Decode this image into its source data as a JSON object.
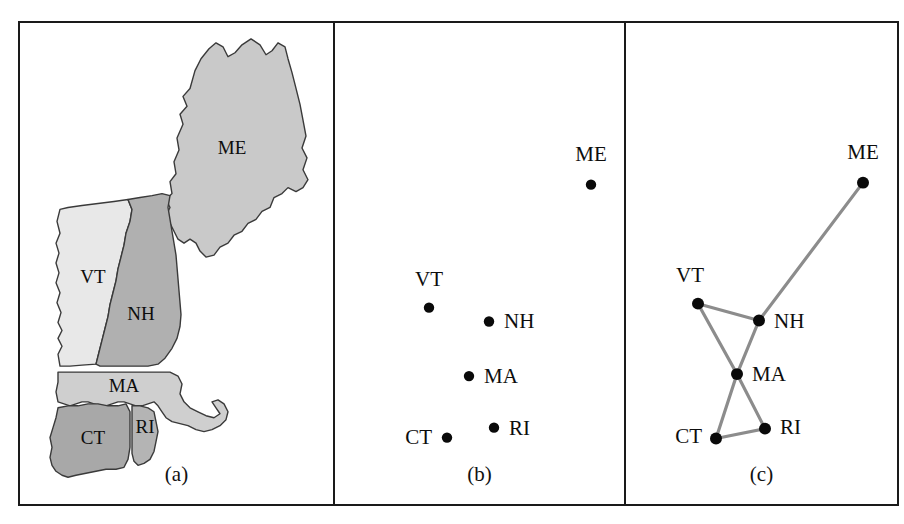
{
  "figure": {
    "width": 904,
    "height": 524,
    "background": "#ffffff",
    "frame_color": "#1a1a1a"
  },
  "panels": [
    {
      "id": "a",
      "caption": "(a)",
      "kind": "choropleth-map"
    },
    {
      "id": "b",
      "caption": "(b)",
      "kind": "scatter"
    },
    {
      "id": "c",
      "caption": "(c)",
      "kind": "graph"
    }
  ],
  "map": {
    "title": "New England states",
    "fills": {
      "ME": "#c9c9c9",
      "VT": "#e8e8e8",
      "NH": "#b0b0b0",
      "MA": "#cfcfcf",
      "CT": "#a8a8a8",
      "RI": "#b4b4b4"
    },
    "outline_color": "#3a3a3a",
    "regions": [
      {
        "code": "ME",
        "label": "ME",
        "label_x": 212,
        "label_y": 128
      },
      {
        "code": "VT",
        "label": "VT",
        "label_x": 73,
        "label_y": 258
      },
      {
        "code": "NH",
        "label": "NH",
        "label_x": 121,
        "label_y": 295
      },
      {
        "code": "MA",
        "label": "MA",
        "label_x": 104,
        "label_y": 368
      },
      {
        "code": "CT",
        "label": "CT",
        "label_x": 73,
        "label_y": 420
      },
      {
        "code": "RI",
        "label": "RI",
        "label_x": 125,
        "label_y": 409
      }
    ]
  },
  "chart_data": {
    "type": "scatter",
    "xlabel": "",
    "ylabel": "",
    "node_color": "#0a0a0a",
    "edge_color": "#8c8c8c",
    "nodes": [
      {
        "id": "ME",
        "label": "ME",
        "x": 571,
        "y": 163,
        "label_x": 571,
        "label_y": 139,
        "label_anchor": "middle"
      },
      {
        "id": "VT",
        "label": "VT",
        "x": 409,
        "y": 287,
        "label_x": 409,
        "label_y": 265,
        "label_anchor": "middle"
      },
      {
        "id": "NH",
        "label": "NH",
        "x": 469,
        "y": 301,
        "label_x": 484,
        "label_y": 308,
        "label_anchor": "start"
      },
      {
        "id": "MA",
        "label": "MA",
        "x": 449,
        "y": 356,
        "label_x": 464,
        "label_y": 363,
        "label_anchor": "start"
      },
      {
        "id": "RI",
        "label": "RI",
        "x": 474,
        "y": 408,
        "label_x": 489,
        "label_y": 415,
        "label_anchor": "start"
      },
      {
        "id": "CT",
        "label": "CT",
        "x": 427,
        "y": 418,
        "label_x": 412,
        "label_y": 425,
        "label_anchor": "end"
      }
    ],
    "graph_nodes": [
      {
        "id": "ME",
        "label": "ME",
        "x": 843,
        "y": 161,
        "label_x": 843,
        "label_y": 137,
        "label_anchor": "middle"
      },
      {
        "id": "VT",
        "label": "VT",
        "x": 678,
        "y": 283,
        "label_x": 670,
        "label_y": 261,
        "label_anchor": "middle"
      },
      {
        "id": "NH",
        "label": "NH",
        "x": 739,
        "y": 300,
        "label_x": 754,
        "label_y": 308,
        "label_anchor": "start"
      },
      {
        "id": "MA",
        "label": "MA",
        "x": 717,
        "y": 354,
        "label_x": 732,
        "label_y": 361,
        "label_anchor": "start"
      },
      {
        "id": "RI",
        "label": "RI",
        "x": 745,
        "y": 409,
        "label_x": 760,
        "label_y": 414,
        "label_anchor": "start"
      },
      {
        "id": "CT",
        "label": "CT",
        "x": 696,
        "y": 419,
        "label_x": 682,
        "label_y": 424,
        "label_anchor": "end"
      }
    ],
    "edges": [
      {
        "source": "ME",
        "target": "NH"
      },
      {
        "source": "VT",
        "target": "NH"
      },
      {
        "source": "VT",
        "target": "MA"
      },
      {
        "source": "NH",
        "target": "MA"
      },
      {
        "source": "MA",
        "target": "RI"
      },
      {
        "source": "MA",
        "target": "CT"
      },
      {
        "source": "CT",
        "target": "RI"
      }
    ]
  }
}
